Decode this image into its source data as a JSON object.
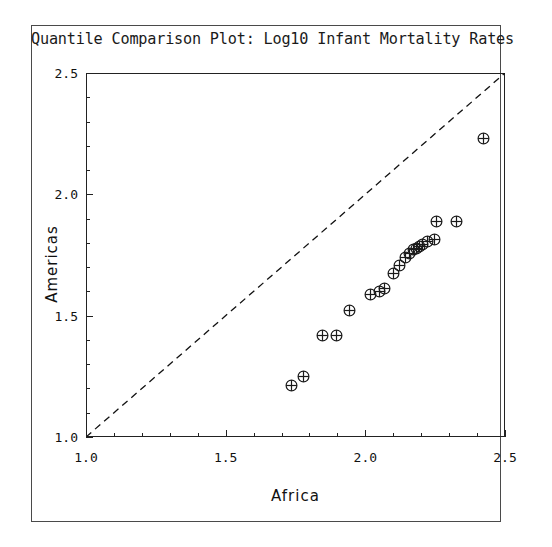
{
  "chart_data": {
    "type": "scatter",
    "title": "Quantile Comparison Plot: Log10 Infant Mortality Rates",
    "xlabel": "Africa",
    "ylabel": "Americas",
    "xlim": [
      1.0,
      2.5
    ],
    "ylim": [
      1.0,
      2.5
    ],
    "xticks": [
      "1.0",
      "1.5",
      "2.0",
      "2.5"
    ],
    "yticks": [
      "1.0",
      "1.5",
      "2.0",
      "2.5"
    ],
    "xtick_values": [
      1.0,
      1.5,
      2.0,
      2.5
    ],
    "ytick_values": [
      1.0,
      1.5,
      2.0,
      2.5
    ],
    "minor_ticks_per_interval": 4,
    "grid": false,
    "legend": "none",
    "marker": "circle-with-cross",
    "marker_color": "#1a1a1a",
    "reference_line": {
      "style": "dashed",
      "color": "#111111",
      "from": [
        1.0,
        1.0
      ],
      "to": [
        2.5,
        2.5
      ],
      "label": "y = x"
    },
    "points": [
      {
        "x": 1.735,
        "y": 1.212
      },
      {
        "x": 1.777,
        "y": 1.248
      },
      {
        "x": 1.845,
        "y": 1.42
      },
      {
        "x": 1.898,
        "y": 1.42
      },
      {
        "x": 1.945,
        "y": 1.522
      },
      {
        "x": 2.018,
        "y": 1.587
      },
      {
        "x": 2.05,
        "y": 1.598
      },
      {
        "x": 2.068,
        "y": 1.613
      },
      {
        "x": 2.1,
        "y": 1.672
      },
      {
        "x": 2.121,
        "y": 1.705
      },
      {
        "x": 2.143,
        "y": 1.74
      },
      {
        "x": 2.158,
        "y": 1.755
      },
      {
        "x": 2.173,
        "y": 1.771
      },
      {
        "x": 2.184,
        "y": 1.777
      },
      {
        "x": 2.195,
        "y": 1.787
      },
      {
        "x": 2.206,
        "y": 1.792
      },
      {
        "x": 2.224,
        "y": 1.806
      },
      {
        "x": 2.249,
        "y": 1.812
      },
      {
        "x": 2.256,
        "y": 1.89
      },
      {
        "x": 2.327,
        "y": 1.89
      },
      {
        "x": 2.424,
        "y": 2.232
      }
    ]
  },
  "figure": {
    "title": "Quantile Comparison Plot: Log10 Infant Mortality Rates",
    "x_axis_title": "Africa",
    "y_axis_title": "Americas"
  }
}
